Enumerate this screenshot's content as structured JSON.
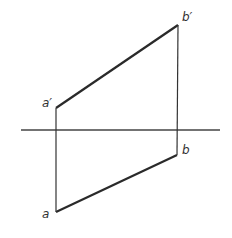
{
  "diagram": {
    "type": "orthographic-projection-of-line-segment",
    "colors": {
      "line": "#2a2a2a",
      "axis": "#444444",
      "background": "#ffffff"
    },
    "axis": {
      "x1": 21,
      "y1": 130,
      "x2": 220,
      "y2": 130
    },
    "points": {
      "a_prime": {
        "label": "a′",
        "x": 56,
        "y": 108
      },
      "b_prime": {
        "label": "b′",
        "x": 178,
        "y": 25
      },
      "a": {
        "label": "a",
        "x": 56,
        "y": 212
      },
      "b": {
        "label": "b",
        "x": 177,
        "y": 155
      }
    },
    "labels": {
      "a_prime": "a′",
      "b_prime": "b′",
      "a": "a",
      "b": "b"
    }
  }
}
